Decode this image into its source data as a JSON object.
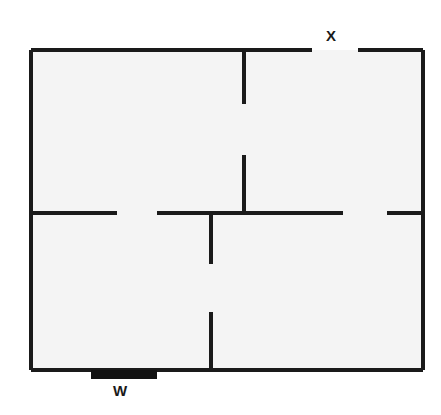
{
  "diagram": {
    "kind": "floor-plan",
    "canvas": {
      "width": 441,
      "height": 415
    },
    "colors": {
      "background": "#ffffff",
      "interior_fill": "#f4f4f4",
      "wall_stroke": "#1a1a1a",
      "window_fill": "#111111",
      "label_color": "#1a1a1a"
    },
    "wall_thickness": 4
  },
  "labels": [
    {
      "id": "x",
      "text": "X",
      "meaning": "opening-in-top-wall",
      "x": 326,
      "y": 28
    },
    {
      "id": "w",
      "text": "W",
      "meaning": "window-on-bottom-wall",
      "x": 113,
      "y": 383
    }
  ],
  "outline": {
    "name": "exterior-outline",
    "left": 31,
    "top": 50,
    "right": 423,
    "bottom": 370,
    "interior_fill": "#f4f4f4"
  },
  "walls": [
    {
      "name": "exterior-wall-top-left",
      "orientation": "horizontal",
      "x1": 31,
      "y1": 50,
      "x2": 312,
      "y2": 50
    },
    {
      "name": "exterior-wall-top-right",
      "orientation": "horizontal",
      "x1": 358,
      "y1": 50,
      "x2": 423,
      "y2": 50
    },
    {
      "name": "exterior-wall-left",
      "orientation": "vertical",
      "x1": 31,
      "y1": 50,
      "x2": 31,
      "y2": 370
    },
    {
      "name": "exterior-wall-right",
      "orientation": "vertical",
      "x1": 423,
      "y1": 50,
      "x2": 423,
      "y2": 370
    },
    {
      "name": "exterior-wall-bottom",
      "orientation": "horizontal",
      "x1": 31,
      "y1": 370,
      "x2": 423,
      "y2": 370
    },
    {
      "name": "interior-wall-upper-vertical",
      "orientation": "vertical",
      "x1": 244,
      "y1": 50,
      "x2": 244,
      "y2": 104
    },
    {
      "name": "interior-wall-mid-vertical",
      "orientation": "vertical",
      "x1": 244,
      "y1": 155,
      "x2": 244,
      "y2": 213
    },
    {
      "name": "interior-wall-lower-vertical-upper",
      "orientation": "vertical",
      "x1": 211,
      "y1": 213,
      "x2": 211,
      "y2": 264
    },
    {
      "name": "interior-wall-lower-vertical-lower",
      "orientation": "vertical",
      "x1": 211,
      "y1": 312,
      "x2": 211,
      "y2": 370
    },
    {
      "name": "interior-wall-mid-horizontal-left",
      "orientation": "horizontal",
      "x1": 31,
      "y1": 213,
      "x2": 117,
      "y2": 213
    },
    {
      "name": "interior-wall-mid-horizontal-center",
      "orientation": "horizontal",
      "x1": 157,
      "y1": 213,
      "x2": 343,
      "y2": 213
    },
    {
      "name": "interior-wall-mid-horizontal-right",
      "orientation": "horizontal",
      "x1": 387,
      "y1": 213,
      "x2": 423,
      "y2": 213
    }
  ],
  "openings": [
    {
      "name": "opening-top-wall-x",
      "orientation": "horizontal",
      "x1": 312,
      "x2": 358,
      "y": 50,
      "label": "X"
    },
    {
      "name": "doorway-mid-horizontal-left",
      "orientation": "horizontal",
      "x1": 117,
      "x2": 157,
      "y": 213,
      "label": ""
    },
    {
      "name": "doorway-mid-horizontal-right",
      "orientation": "horizontal",
      "x1": 343,
      "x2": 387,
      "y": 213,
      "label": ""
    },
    {
      "name": "doorway-vertical-upper",
      "orientation": "vertical",
      "x": 244,
      "y1": 104,
      "y2": 155,
      "label": ""
    },
    {
      "name": "doorway-vertical-lower",
      "orientation": "vertical",
      "x": 211,
      "y1": 264,
      "y2": 312,
      "label": ""
    }
  ],
  "window": {
    "name": "window-w",
    "label": "W",
    "left": 91,
    "top": 370,
    "width": 66,
    "height": 9,
    "fill": "#111111"
  }
}
